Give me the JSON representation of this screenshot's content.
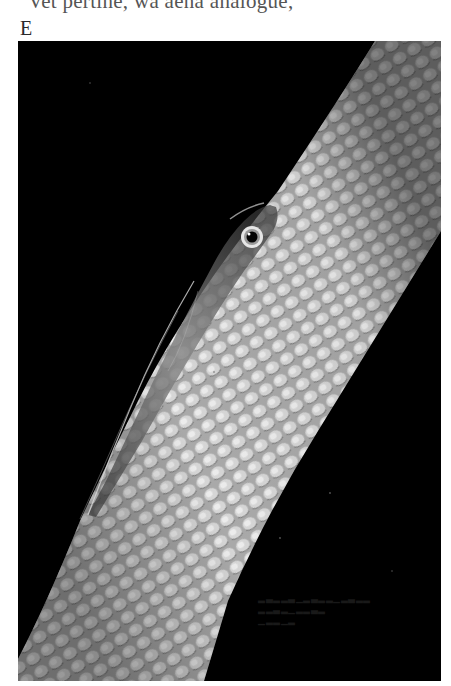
{
  "page": {
    "clipped_text_line": "Vet pertine, wa aena anaiogue,",
    "figure_label": "E"
  },
  "photo": {
    "subject": "Translucent goby resting on a scaled whip-coral stalk against a black background",
    "background_color": "#000000",
    "coral_color": "#c8c8c8",
    "fish_color": "#6e6e6e",
    "bleed_through_text": "illegible reversed print bleed-through"
  },
  "icons": {
    "fish_eye": "eye-icon"
  }
}
